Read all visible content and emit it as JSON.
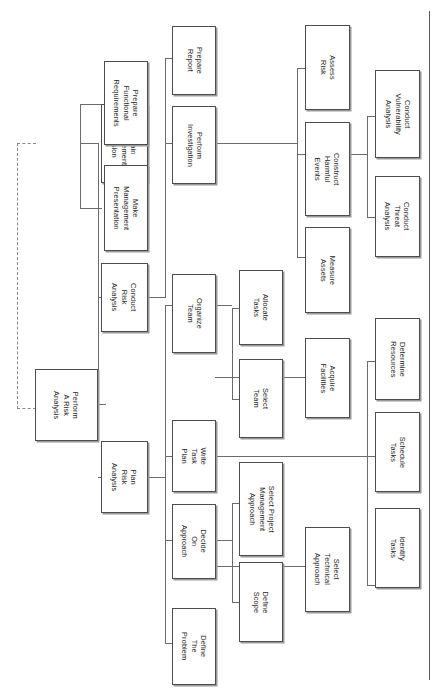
{
  "diagram": {
    "orientation": "rotated-90-clockwise",
    "type": "tree",
    "accent_color": "#4d4d4d",
    "line_color": "#6b6b6b",
    "feedback_line_style": "dashed",
    "nodes": [
      {
        "id": "root",
        "label": "Perform\nA Risk\nAnalysis",
        "level": 0
      },
      {
        "id": "obtain",
        "label": "Obtain\nManagement\nDecision",
        "level": 1
      },
      {
        "id": "conduct_ra",
        "label": "Conduct\nRisk\nAnalysis",
        "level": 1
      },
      {
        "id": "plan_ra",
        "label": "Plan\nRisk\nAnalysis",
        "level": 1
      },
      {
        "id": "prep_func",
        "label": "Prepare\nFunctional\nRequirements",
        "level": 2
      },
      {
        "id": "make_pres",
        "label": "Make\nManagement\nPresentation",
        "level": 2
      },
      {
        "id": "prep_report",
        "label": "Prepare\nReport",
        "level": 3
      },
      {
        "id": "perform_inv",
        "label": "Perform\nInvestigation",
        "level": 3
      },
      {
        "id": "assess_risk",
        "label": "Assess\nRisk",
        "level": 4
      },
      {
        "id": "construct",
        "label": "Construct\nHarmful\nEvents",
        "level": 4
      },
      {
        "id": "measure",
        "label": "Measure\nAssets",
        "level": 4
      },
      {
        "id": "vuln",
        "label": "Conduct\nVulnerability\nAnalysis",
        "level": 5
      },
      {
        "id": "threat",
        "label": "Conduct\nThreat\nAnalysis",
        "level": 5
      },
      {
        "id": "organize",
        "label": "Organize\nTeam",
        "level": 2
      },
      {
        "id": "write_task",
        "label": "Write\nTask\nPlan",
        "level": 2
      },
      {
        "id": "decide",
        "label": "Decide\nOn\nApproach",
        "level": 2
      },
      {
        "id": "define_prob",
        "label": "Define\nThe\nProblem",
        "level": 2
      },
      {
        "id": "allocate",
        "label": "Allocate\nTasks",
        "level": 3
      },
      {
        "id": "select_team",
        "label": "Select\nTeam",
        "level": 3
      },
      {
        "id": "spma",
        "label": "Select Project\nManagement\nApproach",
        "level": 3
      },
      {
        "id": "define_sc",
        "label": "Define\nScope",
        "level": 3
      },
      {
        "id": "acquire",
        "label": "Acquire\nFacilities",
        "level": 4
      },
      {
        "id": "sel_tech",
        "label": "Select\nTechnical\nApproach",
        "level": 4
      },
      {
        "id": "determine",
        "label": "Determine\nResources",
        "level": 5
      },
      {
        "id": "schedule",
        "label": "Schedule\nTasks",
        "level": 5
      },
      {
        "id": "identify",
        "label": "Identify\nTasks",
        "level": 5
      }
    ]
  }
}
